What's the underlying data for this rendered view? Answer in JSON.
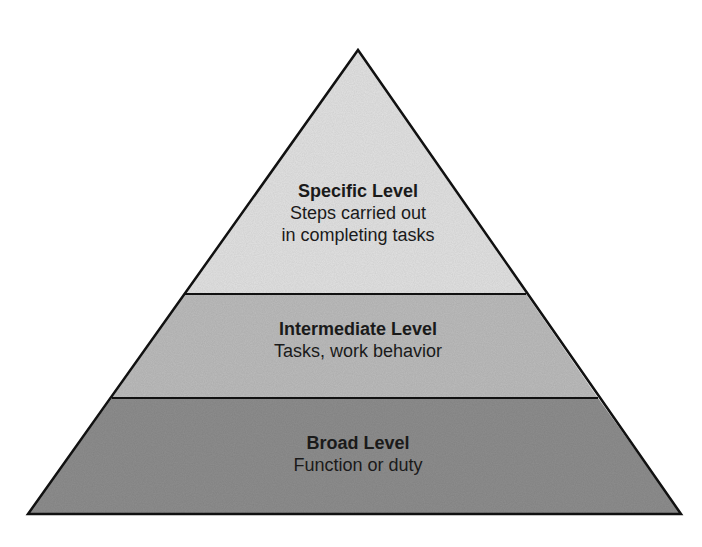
{
  "diagram": {
    "type": "pyramid",
    "levels": [
      {
        "id": "specific",
        "title": "Specific Level",
        "description_lines": [
          "Steps carried out",
          "in completing tasks"
        ],
        "fill": "#e2e2e2"
      },
      {
        "id": "intermediate",
        "title": "Intermediate Level",
        "description_lines": [
          "Tasks, work behavior"
        ],
        "fill": "#bcbcbc"
      },
      {
        "id": "broad",
        "title": "Broad Level",
        "description_lines": [
          "Function or duty"
        ],
        "fill": "#8e8e8e"
      }
    ],
    "stroke_color": "#111111"
  }
}
